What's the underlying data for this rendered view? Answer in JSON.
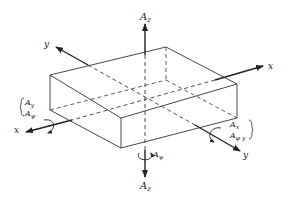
{
  "diagram": {
    "axes": {
      "z_top": {
        "label": "A",
        "sub": "z"
      },
      "z_bottom": {
        "label": "A",
        "sub": "z"
      },
      "y_back": {
        "label": "y"
      },
      "y_front": {
        "label": "y"
      },
      "x_right": {
        "label": "x"
      },
      "x_left": {
        "label": "x"
      }
    },
    "left_group": {
      "translational": {
        "label": "A",
        "sub": "y"
      },
      "rotational": {
        "label": "A",
        "sub": "ψ"
      }
    },
    "right_group": {
      "translational": {
        "label": "A",
        "sub": "x"
      },
      "rotational": {
        "label": "A",
        "sub": "φ y"
      }
    },
    "bottom_rotation": {
      "label": "A",
      "sub": "ψ"
    },
    "colors": {
      "line": "#222222",
      "background": "#ffffff"
    }
  }
}
